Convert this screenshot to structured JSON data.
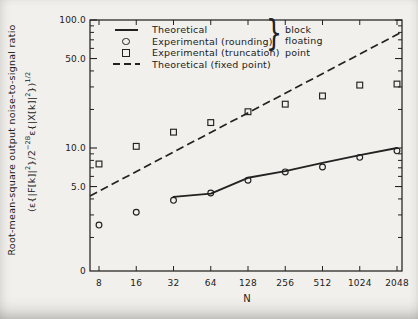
{
  "figure": {
    "bg": "#f1f0ec",
    "ink": "#222222",
    "x_label": "N",
    "y_label_text": "Root-mean-square output noise-to-signal ratio",
    "formula": {
      "p1": "(ε{|F[k]|",
      "s1": "2",
      "p2": "}/2",
      "s2": "−2B",
      "p3": "ε{|X[k]|",
      "s3": "2",
      "p4": "})",
      "s4": "1/2"
    }
  },
  "legend": {
    "entries": [
      {
        "marker": "solid-line",
        "label": "Theoretical"
      },
      {
        "marker": "circle",
        "label": "Experimental (rounding)"
      },
      {
        "marker": "square",
        "label": "Experimental (truncation)"
      },
      {
        "marker": "dashed-line",
        "label": "Theoretical (fixed point)"
      }
    ],
    "brace": "}",
    "brace_words": [
      "block",
      "floating",
      "point"
    ]
  },
  "chart_data": {
    "type": "line",
    "x_scale": "log2",
    "y_scale": "log10",
    "xlabel": "N",
    "ylabel": "Root-mean-square output noise-to-signal ratio (ε{|F[k]|²}/2⁻²ᴮε{|X[k]|²})¹/²",
    "x": [
      8,
      16,
      32,
      64,
      128,
      256,
      512,
      1024,
      2048
    ],
    "x_tick_labels": [
      "8",
      "16",
      "32",
      "64",
      "128",
      "256",
      "512",
      "1024",
      "2048"
    ],
    "y_major_ticks": [
      {
        "v": 100,
        "label": "100.0"
      },
      {
        "v": 50,
        "label": "50.0"
      },
      {
        "v": 10,
        "label": "10.0"
      },
      {
        "v": 5,
        "label": "5.0"
      }
    ],
    "y_minor_ticks": [
      90,
      80,
      70,
      60,
      40,
      30,
      20,
      9,
      8,
      7,
      6,
      4,
      3,
      2
    ],
    "y_origin_label": "0",
    "ylim": [
      1.08,
      100
    ],
    "grid": false,
    "legend_position": "top-left-inside",
    "series": [
      {
        "name": "Theoretical (block floating point)",
        "style": "solid-line",
        "x": [
          32,
          64,
          128,
          256,
          512,
          1024,
          2048
        ],
        "values": [
          4.15,
          4.4,
          5.85,
          6.6,
          7.65,
          8.8,
          10.0
        ]
      },
      {
        "name": "Experimental (rounding)",
        "style": "circle",
        "x": [
          8,
          16,
          32,
          64,
          128,
          256,
          512,
          1024,
          2048
        ],
        "values": [
          2.5,
          3.15,
          3.9,
          4.45,
          5.6,
          6.5,
          7.1,
          8.45,
          9.5
        ]
      },
      {
        "name": "Experimental (truncation)",
        "style": "square",
        "x": [
          8,
          16,
          32,
          64,
          128,
          256,
          512,
          1024,
          2048
        ],
        "values": [
          7.5,
          10.3,
          13.3,
          15.8,
          19.2,
          22.0,
          25.5,
          31.0,
          31.6
        ]
      },
      {
        "name": "Theoretical (fixed point)",
        "style": "dashed-line",
        "extend_to_plot_edges": true,
        "x": [
          8,
          2048
        ],
        "values": [
          4.6,
          77.0
        ]
      }
    ]
  }
}
